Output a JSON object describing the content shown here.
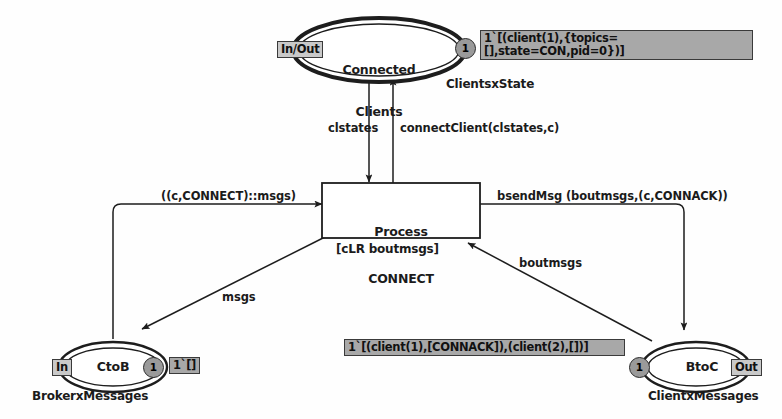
{
  "diagram": {
    "colors": {
      "stroke": "#262626",
      "marking_fill": "#a8a8a8",
      "port_fill": "#c9c9c9",
      "token_fill": "#9a9a9a",
      "background": "#fefefe"
    }
  },
  "places": [
    {
      "id": "connected-clients",
      "name": "Connected\nClients",
      "name_line1": "Connected",
      "name_line2": "Clients",
      "port": "In/Out",
      "type": "ClientsxState",
      "token_count": "1",
      "marking": "1`[(client(1),{topics=[],state=CON,pid=0})]"
    },
    {
      "id": "ctob",
      "name": "CtoB",
      "port": "In",
      "type": "BrokerxMessages",
      "token_count": "1",
      "marking": "1`[]"
    },
    {
      "id": "btoc",
      "name": "BtoC",
      "port": "Out",
      "type": "ClientxMessages",
      "token_count": "1",
      "marking": "1`[(client(1),[CONNACK]),(client(2),[])]"
    }
  ],
  "transitions": [
    {
      "id": "process-connect",
      "name_line1": "Process",
      "name_line2": "CONNECT",
      "guard": "[cLR boutmsgs]"
    }
  ],
  "arcs": [
    {
      "id": "arc-clstates",
      "label": "clstates",
      "from": "connected-clients",
      "to": "process-connect"
    },
    {
      "id": "arc-connectclient",
      "label": "connectClient(clstates,c)",
      "from": "process-connect",
      "to": "connected-clients"
    },
    {
      "id": "arc-connect-msgs",
      "label": "((c,CONNECT)::msgs)",
      "from": "ctob",
      "to": "process-connect"
    },
    {
      "id": "arc-msgs",
      "label": "msgs",
      "from": "process-connect",
      "to": "ctob"
    },
    {
      "id": "arc-bsendmsg",
      "label": "bsendMsg (boutmsgs,(c,CONNACK))",
      "from": "process-connect",
      "to": "btoc"
    },
    {
      "id": "arc-boutmsgs",
      "label": "boutmsgs",
      "from": "btoc",
      "to": "process-connect"
    }
  ]
}
